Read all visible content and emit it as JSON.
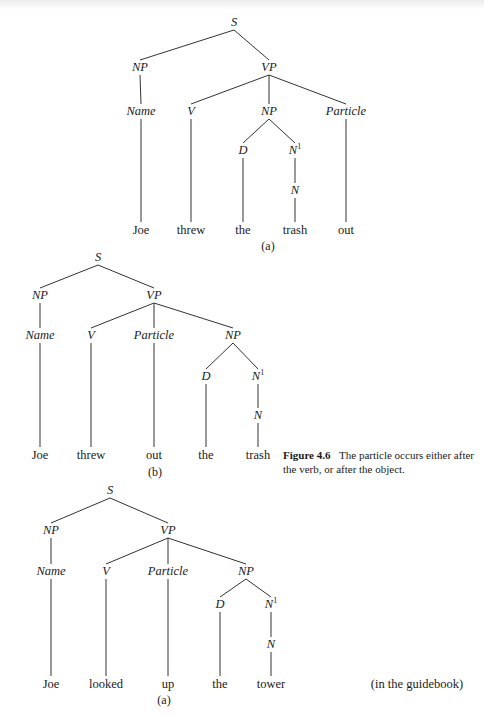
{
  "figure": {
    "label": "Figure 4.6",
    "caption": "The particle occurs either after the verb, or after the object.",
    "note": "(in the guidebook)"
  },
  "trees": [
    {
      "id": "tree-1",
      "subcaption": "(a)",
      "subcaption_pos": [
        268,
        246
      ],
      "sentence": "Joe threw the trash out",
      "nodes": [
        {
          "id": "S",
          "label": "S",
          "sup": "",
          "type": "cat",
          "x": 234,
          "y": 22
        },
        {
          "id": "NP1",
          "label": "NP",
          "sup": "",
          "type": "cat",
          "x": 140,
          "y": 67
        },
        {
          "id": "VP",
          "label": "VP",
          "sup": "",
          "type": "cat",
          "x": 269,
          "y": 67
        },
        {
          "id": "Name",
          "label": "Name",
          "sup": "",
          "type": "cat",
          "x": 141,
          "y": 111
        },
        {
          "id": "V",
          "label": "V",
          "sup": "",
          "type": "cat",
          "x": 191,
          "y": 111
        },
        {
          "id": "NP2",
          "label": "NP",
          "sup": "",
          "type": "cat",
          "x": 269,
          "y": 111
        },
        {
          "id": "Prt",
          "label": "Particle",
          "sup": "",
          "type": "cat",
          "x": 346,
          "y": 111
        },
        {
          "id": "D",
          "label": "D",
          "sup": "",
          "type": "cat",
          "x": 243,
          "y": 150
        },
        {
          "id": "N1",
          "label": "N",
          "sup": "1",
          "type": "cat",
          "x": 295,
          "y": 150
        },
        {
          "id": "N",
          "label": "N",
          "sup": "",
          "type": "cat",
          "x": 295,
          "y": 190
        },
        {
          "id": "w1",
          "label": "Joe",
          "sup": "",
          "type": "word",
          "x": 141,
          "y": 230
        },
        {
          "id": "w2",
          "label": "threw",
          "sup": "",
          "type": "word",
          "x": 191,
          "y": 230
        },
        {
          "id": "w3",
          "label": "the",
          "sup": "",
          "type": "word",
          "x": 243,
          "y": 230
        },
        {
          "id": "w4",
          "label": "trash",
          "sup": "",
          "type": "word",
          "x": 295,
          "y": 230
        },
        {
          "id": "w5",
          "label": "out",
          "sup": "",
          "type": "word",
          "x": 346,
          "y": 230
        }
      ],
      "edges": [
        [
          "S",
          "NP1"
        ],
        [
          "S",
          "VP"
        ],
        [
          "NP1",
          "Name"
        ],
        [
          "VP",
          "V"
        ],
        [
          "VP",
          "NP2"
        ],
        [
          "VP",
          "Prt"
        ],
        [
          "NP2",
          "D"
        ],
        [
          "NP2",
          "N1"
        ],
        [
          "N1",
          "N"
        ],
        [
          "Name",
          "w1"
        ],
        [
          "V",
          "w2"
        ],
        [
          "D",
          "w3"
        ],
        [
          "N",
          "w4"
        ],
        [
          "Prt",
          "w5"
        ]
      ]
    },
    {
      "id": "tree-2",
      "subcaption": "(b)",
      "subcaption_pos": [
        155,
        472
      ],
      "sentence": "Joe threw out the trash",
      "nodes": [
        {
          "id": "S",
          "label": "S",
          "sup": "",
          "type": "cat",
          "x": 98,
          "y": 257
        },
        {
          "id": "NP1",
          "label": "NP",
          "sup": "",
          "type": "cat",
          "x": 40,
          "y": 295
        },
        {
          "id": "VP",
          "label": "VP",
          "sup": "",
          "type": "cat",
          "x": 154,
          "y": 295
        },
        {
          "id": "Name",
          "label": "Name",
          "sup": "",
          "type": "cat",
          "x": 40,
          "y": 335
        },
        {
          "id": "V",
          "label": "V",
          "sup": "",
          "type": "cat",
          "x": 91,
          "y": 335
        },
        {
          "id": "Prt",
          "label": "Particle",
          "sup": "",
          "type": "cat",
          "x": 154,
          "y": 335
        },
        {
          "id": "NP2",
          "label": "NP",
          "sup": "",
          "type": "cat",
          "x": 233,
          "y": 335
        },
        {
          "id": "D",
          "label": "D",
          "sup": "",
          "type": "cat",
          "x": 206,
          "y": 376
        },
        {
          "id": "N1",
          "label": "N",
          "sup": "1",
          "type": "cat",
          "x": 258,
          "y": 376
        },
        {
          "id": "N",
          "label": "N",
          "sup": "",
          "type": "cat",
          "x": 258,
          "y": 415
        },
        {
          "id": "w1",
          "label": "Joe",
          "sup": "",
          "type": "word",
          "x": 40,
          "y": 455
        },
        {
          "id": "w2",
          "label": "threw",
          "sup": "",
          "type": "word",
          "x": 91,
          "y": 455
        },
        {
          "id": "w3",
          "label": "out",
          "sup": "",
          "type": "word",
          "x": 154,
          "y": 455
        },
        {
          "id": "w4",
          "label": "the",
          "sup": "",
          "type": "word",
          "x": 206,
          "y": 455
        },
        {
          "id": "w5",
          "label": "trash",
          "sup": "",
          "type": "word",
          "x": 258,
          "y": 455
        }
      ],
      "edges": [
        [
          "S",
          "NP1"
        ],
        [
          "S",
          "VP"
        ],
        [
          "NP1",
          "Name"
        ],
        [
          "VP",
          "V"
        ],
        [
          "VP",
          "Prt"
        ],
        [
          "VP",
          "NP2"
        ],
        [
          "NP2",
          "D"
        ],
        [
          "NP2",
          "N1"
        ],
        [
          "N1",
          "N"
        ],
        [
          "Name",
          "w1"
        ],
        [
          "V",
          "w2"
        ],
        [
          "Prt",
          "w3"
        ],
        [
          "D",
          "w4"
        ],
        [
          "N",
          "w5"
        ]
      ]
    },
    {
      "id": "tree-3",
      "subcaption": "(a)",
      "subcaption_pos": [
        164,
        700
      ],
      "sentence": "Joe looked up the tower",
      "nodes": [
        {
          "id": "S",
          "label": "S",
          "sup": "",
          "type": "cat",
          "x": 110,
          "y": 490
        },
        {
          "id": "NP1",
          "label": "NP",
          "sup": "",
          "type": "cat",
          "x": 51,
          "y": 530
        },
        {
          "id": "VP",
          "label": "VP",
          "sup": "",
          "type": "cat",
          "x": 168,
          "y": 530
        },
        {
          "id": "Name",
          "label": "Name",
          "sup": "",
          "type": "cat",
          "x": 51,
          "y": 571
        },
        {
          "id": "V",
          "label": "V",
          "sup": "",
          "type": "cat",
          "x": 106,
          "y": 571
        },
        {
          "id": "Prt",
          "label": "Particle",
          "sup": "",
          "type": "cat",
          "x": 168,
          "y": 571
        },
        {
          "id": "NP2",
          "label": "NP",
          "sup": "",
          "type": "cat",
          "x": 246,
          "y": 571
        },
        {
          "id": "D",
          "label": "D",
          "sup": "",
          "type": "cat",
          "x": 220,
          "y": 604
        },
        {
          "id": "N1",
          "label": "N",
          "sup": "1",
          "type": "cat",
          "x": 271,
          "y": 604
        },
        {
          "id": "N",
          "label": "N",
          "sup": "",
          "type": "cat",
          "x": 271,
          "y": 644
        },
        {
          "id": "w1",
          "label": "Joe",
          "sup": "",
          "type": "word",
          "x": 51,
          "y": 684
        },
        {
          "id": "w2",
          "label": "looked",
          "sup": "",
          "type": "word",
          "x": 106,
          "y": 684
        },
        {
          "id": "w3",
          "label": "up",
          "sup": "",
          "type": "word",
          "x": 168,
          "y": 684
        },
        {
          "id": "w4",
          "label": "the",
          "sup": "",
          "type": "word",
          "x": 220,
          "y": 684
        },
        {
          "id": "w5",
          "label": "tower",
          "sup": "",
          "type": "word",
          "x": 271,
          "y": 684
        }
      ],
      "edges": [
        [
          "S",
          "NP1"
        ],
        [
          "S",
          "VP"
        ],
        [
          "NP1",
          "Name"
        ],
        [
          "VP",
          "V"
        ],
        [
          "VP",
          "Prt"
        ],
        [
          "VP",
          "NP2"
        ],
        [
          "NP2",
          "D"
        ],
        [
          "NP2",
          "N1"
        ],
        [
          "N1",
          "N"
        ],
        [
          "Name",
          "w1"
        ],
        [
          "V",
          "w2"
        ],
        [
          "Prt",
          "w3"
        ],
        [
          "D",
          "w4"
        ],
        [
          "N",
          "w5"
        ]
      ]
    }
  ],
  "note_pos": [
    417,
    684
  ]
}
